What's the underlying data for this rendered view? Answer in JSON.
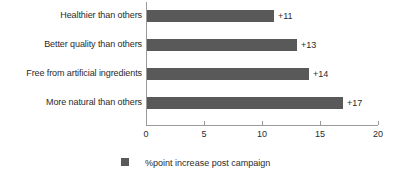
{
  "chart_data": {
    "type": "bar",
    "orientation": "horizontal",
    "title": "",
    "subtitle": "",
    "xlabel": "",
    "ylabel": "",
    "xlim": [
      0,
      20
    ],
    "xticks": [
      "0",
      "5",
      "10",
      "15",
      "20"
    ],
    "grid": false,
    "legend_position": "bottom-center",
    "bar_color": "#595959",
    "axis_color": "#9a9a9a",
    "text_color": "#2b2b2b",
    "categories": [
      "Healthier than others",
      "Better quality than others",
      "Free from artificial ingredients",
      "More natural than others"
    ],
    "values": [
      11,
      13,
      14,
      17
    ],
    "data_labels": [
      "+11",
      "+13",
      "+14",
      "+17"
    ],
    "series": [
      {
        "name": "%point increase post campaign",
        "values": [
          11,
          13,
          14,
          17
        ]
      }
    ],
    "legend": [
      {
        "label": "%point increase post campaign",
        "color": "#595959"
      }
    ]
  }
}
